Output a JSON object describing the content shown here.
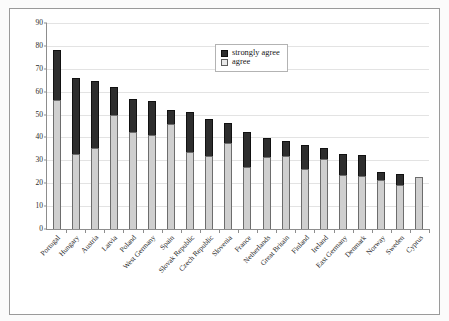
{
  "chart_data": {
    "type": "bar",
    "subtype": "stacked-vertical",
    "title": "",
    "subtitle": "",
    "xlabel": "",
    "ylabel": "",
    "ylim": [
      0,
      90
    ],
    "yticks": [
      0,
      10,
      20,
      30,
      40,
      50,
      60,
      70,
      80,
      90
    ],
    "grid": true,
    "grid_axis": "y",
    "legend_position": "top-center",
    "categories": [
      "Portugal",
      "Hungary",
      "Austria",
      "Latvia",
      "Poland",
      "West Germany",
      "Spain",
      "Slovak Republic",
      "Czech Republic",
      "Slovenia",
      "France",
      "Netherlands",
      "Great Britain",
      "Finland",
      "Ireland",
      "East Germany",
      "Denmark",
      "Norway",
      "Sweden",
      "Cyprus"
    ],
    "series": [
      {
        "name": "agree",
        "color": "#cfcfcf",
        "values": [
          56.5,
          32.7,
          35.3,
          49.6,
          42.6,
          41.0,
          46.0,
          33.5,
          32.0,
          37.4,
          27.2,
          31.5,
          32.0,
          26.2,
          30.8,
          23.7,
          23.0,
          21.2,
          19.3,
          22.6
        ]
      },
      {
        "name": "strongly agree",
        "color": "#2e2e2e",
        "values": [
          21.5,
          33.5,
          29.4,
          12.4,
          14.3,
          14.8,
          6.2,
          17.6,
          16.2,
          9.0,
          15.3,
          8.3,
          6.5,
          10.4,
          4.8,
          9.0,
          9.4,
          3.7,
          4.6,
          0.0
        ]
      }
    ],
    "totals": [
      78.0,
      66.2,
      64.7,
      62.0,
      56.9,
      55.8,
      52.2,
      51.1,
      48.2,
      46.4,
      42.5,
      39.8,
      38.5,
      36.6,
      35.6,
      32.7,
      32.4,
      24.9,
      23.9,
      22.6
    ]
  },
  "legend": {
    "entries": [
      {
        "label": "strongly agree",
        "swatch": "dark-square-swatch"
      },
      {
        "label": "agree",
        "swatch": "light-square-swatch"
      }
    ]
  },
  "axis": {
    "y_tick_labels": [
      "90",
      "80",
      "70",
      "60",
      "50",
      "40",
      "30",
      "20",
      "10",
      "0"
    ]
  }
}
